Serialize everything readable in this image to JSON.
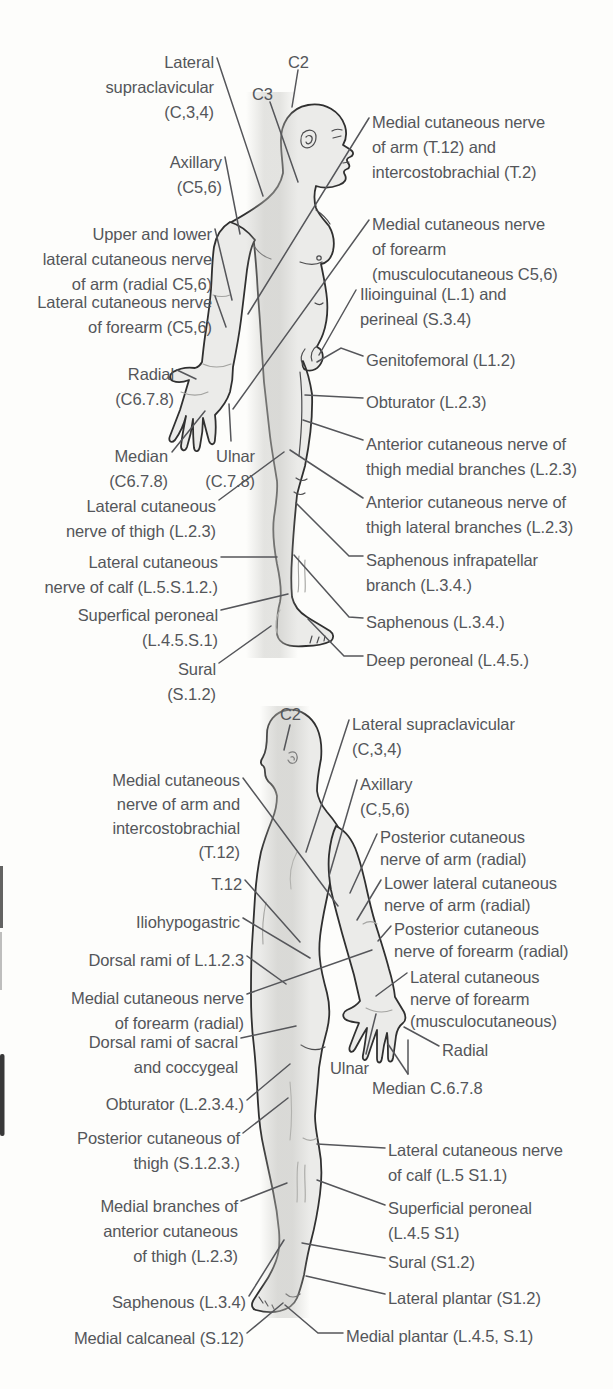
{
  "diagram_title": "Cutaneous nerve distribution of the body",
  "colors": {
    "background": "#fdfdfb",
    "text": "#54565a",
    "leader_line": "#55565a",
    "body_fill": "#ebebe9",
    "body_outline": "#303030"
  },
  "anterior": {
    "view": "anterior-lateral standing figure, facing right",
    "labels": {
      "c2": "C2",
      "c3": "C3",
      "lateral_supraclavicular": "Lateral\nsupraclavicular\n(C,3,4)",
      "axillary": "Axillary\n(C5,6)",
      "upper_lower_lateral_arm": "Upper and lower\nlateral cutaneous nerve\nof arm (radial C5,6)",
      "lateral_forearm": "Lateral cutaneous nerve\nof forearm (C5,6)",
      "radial": "Radial\n(C6.7.8)",
      "median": "Median\n(C6.7.8)",
      "ulnar": "Ulnar\n(C.7.8)",
      "lateral_thigh": "Lateral cutaneous\nnerve of thigh (L.2.3)",
      "lateral_calf": "Lateral cutaneous\nnerve of calf (L.5.S.1.2.)",
      "superficial_peroneal": "Superfical peroneal\n(L.4.5.S.1)",
      "sural": "Sural\n(S.1.2)",
      "medial_arm": "Medial cutaneous nerve\nof arm (T.12) and\nintercostobrachial (T.2)",
      "medial_forearm": "Medial cutaneous nerve\nof forearm\n(musculocutaneous C5,6)",
      "ilioinguinal": "Ilioinguinal (L.1) and\nperineal (S.3.4)",
      "genitofemoral": "Genitofemoral (L1.2)",
      "obturator": "Obturator (L.2.3)",
      "anterior_thigh_medial": "Anterior cutaneous nerve of\nthigh medial branches (L.2.3)",
      "anterior_thigh_lateral": "Anterior cutaneous nerve of\nthigh lateral branches (L.2.3)",
      "saphenous_infrapatellar": "Saphenous infrapatellar\nbranch (L.3.4.)",
      "saphenous": "Saphenous (L.3.4.)",
      "deep_peroneal": "Deep peroneal (L.4.5.)"
    }
  },
  "posterior": {
    "view": "posterior standing figure, facing left",
    "labels": {
      "c2": "C2",
      "lateral_supraclavicular": "Lateral supraclavicular\n(C,3,4)",
      "medial_arm_intercostobrachial": "Medial cutaneous\nnerve of arm and\nintercostobrachial\n(T.12)",
      "axillary": "Axillary\n(C,5,6)",
      "posterior_arm": "Posterior cutaneous\nnerve of arm (radial)",
      "lower_lateral_arm": "Lower lateral cutaneous\nnerve of arm (radial)",
      "t12": "T.12",
      "posterior_forearm": "Posterior cutaneous\nnerve of forearm (radial)",
      "iliohypogastric": "Iliohypogastric",
      "dorsal_rami_l123": "Dorsal rami of L.1.2.3",
      "lateral_forearm_musculocutaneous": "Lateral cutaneous\nnerve of forearm\n(musculocutaneous)",
      "medial_forearm_radial": "Medial cutaneous nerve\nof forearm (radial)",
      "dorsal_rami_sacral": "Dorsal rami of sacral\nand coccygeal",
      "radial": "Radial",
      "ulnar": "Ulnar",
      "median": "Median C.6.7.8",
      "obturator": "Obturator (L.2.3.4.)",
      "posterior_thigh": "Posterior cutaneous of\nthigh (S.1.2.3.)",
      "medial_branches_anterior_thigh": "Medial branches of\nanterior cutaneous\nof thigh (L.2.3)",
      "saphenous": "Saphenous (L.3.4)",
      "medial_calcaneal": "Medial calcaneal (S.12)",
      "lateral_calf": "Lateral cutaneous nerve\nof calf (L.5 S1.1)",
      "superficial_peroneal": "Superficial peroneal\n(L.4.5 S1)",
      "sural": "Sural (S1.2)",
      "lateral_plantar": "Lateral plantar (S1.2)",
      "medial_plantar": "Medial plantar  (L.4.5, S.1)"
    }
  }
}
